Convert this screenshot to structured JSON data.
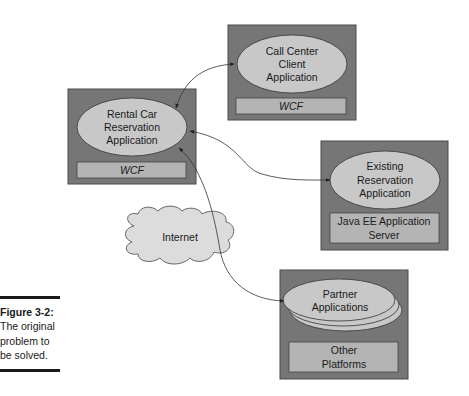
{
  "figure": {
    "label": "Figure 3-2:",
    "caption_lines": [
      "The original",
      "problem to",
      "be solved."
    ]
  },
  "colors": {
    "box_fill": "#767676",
    "box_border": "#4a4a4a",
    "ellipse_fill": "#c8c8c8",
    "bar_fill": "#b4b4b4",
    "cloud_fill": "#dcdcdc",
    "line": "#333333",
    "text": "#1a1a1a"
  },
  "nodes": {
    "call_center": {
      "lines": [
        "Call Center",
        "Client",
        "Application"
      ],
      "platform": [
        "WCF"
      ]
    },
    "rental_car": {
      "lines": [
        "Rental Car",
        "Reservation",
        "Application"
      ],
      "platform": [
        "WCF"
      ]
    },
    "existing": {
      "lines": [
        "Existing",
        "Reservation",
        "Application"
      ],
      "platform": [
        "Java EE Application",
        "Server"
      ]
    },
    "partner": {
      "lines": [
        "Partner",
        "Applications"
      ],
      "platform": [
        "Other",
        "Platforms"
      ]
    },
    "internet": {
      "label": "Internet"
    }
  },
  "connections": [
    {
      "from": "rental_car",
      "to": "call_center",
      "bidirectional": true
    },
    {
      "from": "rental_car",
      "to": "existing",
      "bidirectional": true
    },
    {
      "from": "rental_car",
      "to": "partner",
      "bidirectional": true,
      "via": "internet"
    }
  ]
}
